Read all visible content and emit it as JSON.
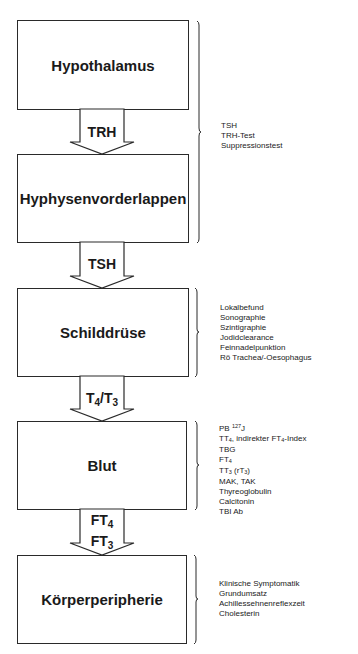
{
  "diagram": {
    "boxes": [
      {
        "id": "hypothalamus",
        "label": "Hypothalamus"
      },
      {
        "id": "hypophysenvorderlappen",
        "label": "Hyphysenvorderlappen"
      },
      {
        "id": "schilddruese",
        "label": "Schilddrüse"
      },
      {
        "id": "blut",
        "label": "Blut"
      },
      {
        "id": "koerperperipherie",
        "label": "Körperperipherie"
      }
    ],
    "arrows": [
      {
        "label": "TRH"
      },
      {
        "label": "TSH"
      },
      {
        "label_main": "T",
        "label_sub1": "4",
        "label_sep": "/T",
        "label_sub2": "3"
      },
      {
        "line1_main": "FT",
        "line1_sub": "4",
        "line2_main": "FT",
        "line2_sub": "3"
      }
    ],
    "test_groups": [
      {
        "target": "hypothalamus-hypophyse",
        "items": [
          "TSH",
          "TRH-Test",
          "Suppressionstest"
        ]
      },
      {
        "target": "schilddruese",
        "items": [
          "Lokalbefund",
          "Sonographie",
          "Szintigraphie",
          "Jodidclearance",
          "Feinnadelpunktion",
          "Rö Trachea/-Oesophagus"
        ]
      },
      {
        "target": "blut",
        "items": [
          {
            "text": "PB ",
            "sup": "127",
            "after": "J"
          },
          {
            "text": "TT",
            "sub": "4",
            "after": ", indirekter FT",
            "sub2": "4",
            "after2": "-Index"
          },
          {
            "text": "TBG"
          },
          {
            "text": "FT",
            "sub": "4"
          },
          {
            "text": "TT",
            "sub": "3",
            "after": " (rT",
            "sub2": "3",
            "after2": ")"
          },
          {
            "text": "MAK, TAK"
          },
          {
            "text": "Thyreoglobulin"
          },
          {
            "text": "Calcitonin"
          },
          {
            "text": "TBI Ab"
          }
        ]
      },
      {
        "target": "koerperperipherie",
        "items": [
          "Klinische Symptomatik",
          "Grundumsatz",
          "Achillessehnenreflexzeit",
          "Cholesterin"
        ]
      }
    ],
    "colors": {
      "line": "#2a2a2a",
      "background": "#ffffff",
      "text": "#1a1a1a"
    }
  }
}
